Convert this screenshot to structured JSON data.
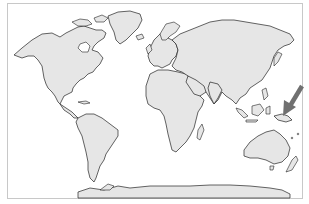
{
  "map": {
    "type": "world-map",
    "projection": "equirectangular-like",
    "land_color": "#e6e6e6",
    "coastline_color": "#222222",
    "frame_color": "#c8c8c8",
    "background_color": "#ffffff"
  },
  "annotation": {
    "type": "arrow",
    "color": "#707070",
    "points_to": "Papua New Guinea / western Pacific",
    "description": "Gray arrow pointing southwest toward New Guinea region"
  }
}
